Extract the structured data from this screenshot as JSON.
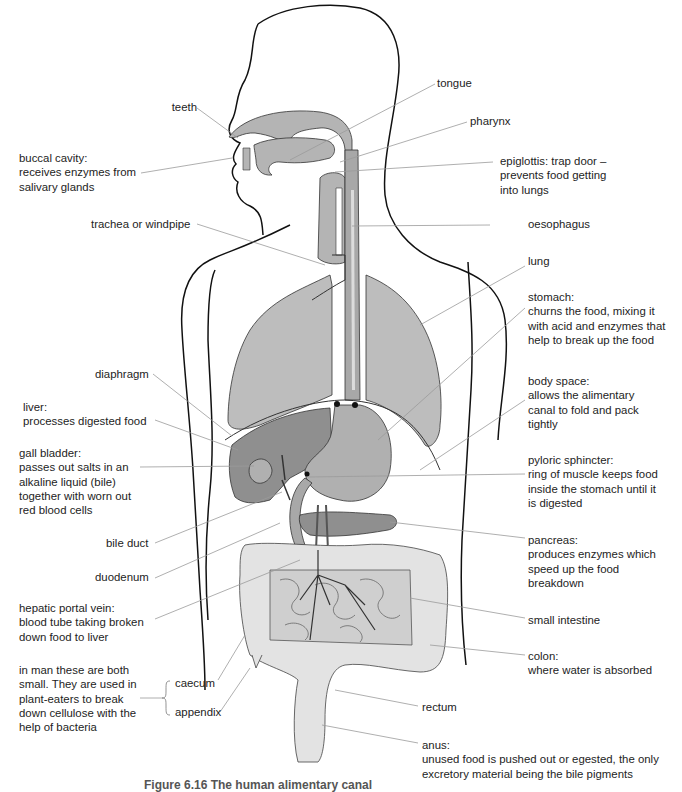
{
  "figure": {
    "caption": "Figure 6.16 The human alimentary canal",
    "colors": {
      "outline": "#111111",
      "organ_light": "#c8c8c8",
      "organ_mid": "#a9a9a9",
      "organ_dark": "#8f8f8f",
      "intestine_fill": "#e3e3e3",
      "leader_line": "#9a9a9a"
    }
  },
  "labels": {
    "teeth": "teeth",
    "tongue": "tongue",
    "pharynx": "pharynx",
    "buccal": "buccal cavity:\nreceives enzymes from\nsalivary glands",
    "epiglottis": "epiglottis: trap door –\nprevents food getting\ninto lungs",
    "trachea": "trachea or windpipe",
    "oesophagus": "oesophagus",
    "lung": "lung",
    "stomach": "stomach:\nchurns the food, mixing it\nwith acid and enzymes that\nhelp to break up the food",
    "diaphragm": "diaphragm",
    "liver": "liver:\nprocesses digested food",
    "body_space": "body space:\nallows the alimentary\ncanal to fold and pack\ntightly",
    "gall_bladder": "gall bladder:\npasses out salts in an\nalkaline liquid (bile)\ntogether with worn out\nred blood cells",
    "pyloric": "pyloric sphincter:\nring of muscle keeps food\ninside the stomach until it\nis digested",
    "bile_duct": "bile duct",
    "pancreas": "pancreas:\nproduces enzymes which\nspeed up the food\nbreakdown",
    "duodenum": "duodenum",
    "hepatic": "hepatic portal vein:\nblood tube taking broken\ndown food to liver",
    "small_intestine": "small intestine",
    "colon": "colon:\nwhere water is absorbed",
    "in_man": "in man these are both\nsmall. They are used in\nplant-eaters to break\ndown cellulose with the\nhelp of bacteria",
    "caecum": "caecum",
    "appendix": "appendix",
    "rectum": "rectum",
    "anus": "anus:\nunused food is pushed out or egested, the only\nexcretory material being the bile pigments"
  }
}
